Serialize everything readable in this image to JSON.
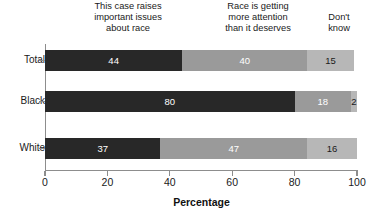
{
  "chart_data": {
    "type": "bar",
    "orientation": "horizontal",
    "stacked": true,
    "title": "",
    "subtitle": "",
    "xlabel": "Percentage",
    "ylabel": "",
    "xlim": [
      0,
      100
    ],
    "xticks": [
      0,
      20,
      40,
      60,
      80,
      100
    ],
    "grid": false,
    "legend_position": "top-inline-column-headers",
    "categories": [
      "Total",
      "Black",
      "White"
    ],
    "series": [
      {
        "name": "This case raises important issues about race",
        "name_lines": [
          "This case raises",
          "important issues",
          "about race"
        ],
        "color": "#282828",
        "values": [
          44,
          80,
          37
        ]
      },
      {
        "name": "Race is getting more attention than it deserves",
        "name_lines": [
          "Race is getting",
          "more attention",
          "than it deserves"
        ],
        "color": "#9a9a9a",
        "values": [
          40,
          18,
          47
        ]
      },
      {
        "name": "Don't know",
        "name_lines": [
          "Don't",
          "know"
        ],
        "color": "#b7b7b7",
        "values": [
          15,
          2,
          16
        ]
      }
    ],
    "bar_labels": {
      "Total": [
        "44",
        "40",
        "15"
      ],
      "Black": [
        "80",
        "18",
        "2"
      ],
      "White": [
        "37",
        "47",
        "16"
      ]
    }
  },
  "headers": {
    "col_a": {
      "line1": "This case raises",
      "line2": "important issues",
      "line3": "about race"
    },
    "col_b": {
      "line1": "Race is getting",
      "line2": "more attention",
      "line3": "than it deserves"
    },
    "col_c": {
      "line1": "Don't",
      "line2": "know"
    }
  },
  "axis": {
    "x_title": "Percentage",
    "x_tick_labels": [
      "0",
      "20",
      "40",
      "60",
      "80",
      "100"
    ],
    "y_tick_labels": [
      "Total",
      "Black",
      "White"
    ]
  },
  "rows": {
    "total": {
      "label": "Total",
      "s1": "44",
      "s2": "40",
      "s3": "15"
    },
    "black": {
      "label": "Black",
      "s1": "80",
      "s2": "18",
      "s3": "2"
    },
    "white": {
      "label": "White",
      "s1": "37",
      "s2": "47",
      "s3": "16"
    }
  },
  "colors": {
    "segment_1": "#282828",
    "segment_2": "#9a9a9a",
    "segment_3": "#b7b7b7",
    "axis": "#8d8d8d",
    "text": "#1a1a1a"
  }
}
